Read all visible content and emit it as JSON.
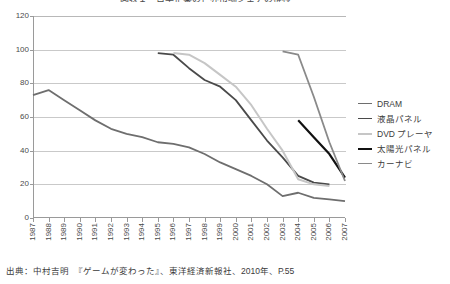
{
  "chart_data": {
    "type": "line",
    "title": "図表１　日本企業の世界市場シェアの推移",
    "xlabel": "",
    "ylabel": "",
    "ylim": [
      0,
      120
    ],
    "yticks": [
      0,
      20,
      40,
      60,
      80,
      100,
      120
    ],
    "grid": true,
    "legend_position": "right",
    "x": [
      1987,
      1988,
      1989,
      1990,
      1991,
      1992,
      1993,
      1994,
      1995,
      1996,
      1997,
      1998,
      1999,
      2000,
      2001,
      2002,
      2003,
      2004,
      2005,
      2006,
      2007
    ],
    "series": [
      {
        "name": "DRAM",
        "color": "#6e6e6e",
        "width": 1.8,
        "x": [
          1987,
          1988,
          1989,
          1990,
          1991,
          1992,
          1993,
          1994,
          1995,
          1996,
          1997,
          1998,
          1999,
          2000,
          2001,
          2002,
          2003,
          2004,
          2005,
          2006,
          2007
        ],
        "values": [
          73,
          76,
          70,
          64,
          58,
          53,
          50,
          48,
          45,
          44,
          42,
          38,
          33,
          29,
          25,
          20,
          13,
          15,
          12,
          11,
          10
        ]
      },
      {
        "name": "液晶パネル",
        "color": "#4a4a4a",
        "width": 1.8,
        "x": [
          1995,
          1996,
          1997,
          1998,
          1999,
          2000,
          2001,
          2002,
          2003,
          2004,
          2005,
          2006
        ],
        "values": [
          98,
          97,
          89,
          82,
          78,
          70,
          58,
          46,
          36,
          25,
          21,
          20
        ]
      },
      {
        "name": "DVD プレーヤ",
        "color": "#c6c6c6",
        "width": 2.0,
        "x": [
          1996,
          1997,
          1998,
          1999,
          2000,
          2001,
          2002,
          2003,
          2004,
          2005,
          2006
        ],
        "values": [
          98,
          97,
          92,
          85,
          78,
          67,
          53,
          40,
          23,
          20,
          19
        ]
      },
      {
        "name": "太陽光パネル",
        "color": "#111111",
        "width": 2.2,
        "x": [
          2004,
          2005,
          2006,
          2007
        ],
        "values": [
          58,
          48,
          38,
          24
        ]
      },
      {
        "name": "カーナビ",
        "color": "#8a8a8a",
        "width": 1.8,
        "x": [
          2003,
          2004,
          2005,
          2006,
          2007
        ],
        "values": [
          99,
          97,
          72,
          45,
          22
        ]
      }
    ]
  },
  "legend": {
    "items": [
      {
        "label": "DRAM"
      },
      {
        "label": "液晶パネル"
      },
      {
        "label": "DVD プレーヤ"
      },
      {
        "label": "太陽光パネル"
      },
      {
        "label": "カーナビ"
      }
    ]
  },
  "source": {
    "text": "出典：中村吉明　『ゲームが変わった』、東洋経済新報社、2010年、P.55"
  },
  "colors": {
    "axis": "#9a9a9a",
    "grid": "#c9c9c9",
    "text": "#3b3b3b",
    "background": "#ffffff"
  }
}
